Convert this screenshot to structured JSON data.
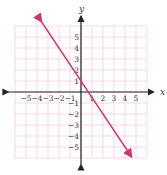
{
  "chart_data": {
    "type": "line",
    "title": "",
    "xlabel": "x",
    "ylabel": "y",
    "xlim": [
      -6,
      6
    ],
    "ylim": [
      -6,
      6
    ],
    "grid": true,
    "x_ticks": [
      -5,
      -4,
      -3,
      -2,
      -1,
      1,
      2,
      3,
      4,
      5
    ],
    "y_ticks": [
      5,
      4,
      3,
      2,
      1,
      -1,
      -2,
      -3,
      -4,
      -5
    ],
    "series": [
      {
        "name": "line",
        "color": "#d6336c",
        "equation": "y = -1.5x + 1",
        "x": [
          -3.6,
          4.6
        ],
        "y": [
          6.4,
          -5.9
        ]
      }
    ]
  },
  "labels": {
    "x": "x",
    "y": "y"
  },
  "colors": {
    "line": "#d6336c",
    "grid": "#f2c9d4",
    "axis": "#222222"
  }
}
